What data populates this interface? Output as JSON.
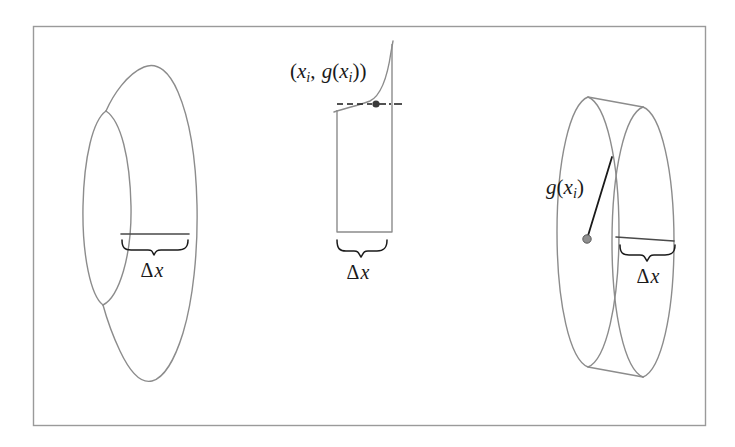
{
  "figure": {
    "name": "disk-method-volume-of-revolution",
    "background_color": "#ffffff",
    "frame": {
      "name": "figure-border",
      "stroke": "#9a9a9a",
      "x": 33,
      "y": 26,
      "width": 672,
      "height": 399
    },
    "line_color": "#8c8c8c",
    "ink_color": "#1a1a1a"
  },
  "labels": {
    "point_label": "(xᵢ, g(xᵢ))",
    "point_label_parts": {
      "open": "(",
      "x": "x",
      "x_sub": "i",
      "comma": ", ",
      "g": "g",
      "g_open": "(",
      "g_x": "x",
      "g_x_sub": "i",
      "g_close": ")",
      "close": ")"
    },
    "radius_label": "g(xᵢ)",
    "radius_label_parts": {
      "g": "g",
      "open": "(",
      "x": "x",
      "x_sub": "i",
      "close": ")"
    },
    "delta_x": "Δx",
    "delta_x_parts": {
      "delta": "Δ",
      "x": "x"
    }
  },
  "panels": [
    {
      "name": "solid-of-revolution",
      "index": 0,
      "description": "Solid of revolution with a shaded slice of width delta-x",
      "delta_x_label": "Δx",
      "delta_x_label_x": 152,
      "delta_x_label_y": 272
    },
    {
      "name": "representative-rectangle",
      "index": 1,
      "description": "Representative rectangle under the curve y = g(x) touching the point (x_i, g(x_i))",
      "point_label": "(xᵢ, g(xᵢ))",
      "point_label_x": 290,
      "point_label_y": 73,
      "delta_x_label": "Δx",
      "delta_x_label_x": 358,
      "delta_x_label_y": 272,
      "rectangle": {
        "left": 337,
        "right": 392,
        "top": 108,
        "bottom": 232
      },
      "marked_point": {
        "x": 376,
        "y": 104
      }
    },
    {
      "name": "disk-element",
      "index": 2,
      "description": "Circular disk of radius g(x_i) and thickness delta-x",
      "radius_label": "g(xᵢ)",
      "radius_label_x": 565,
      "radius_label_y": 188,
      "delta_x_label": "Δx",
      "delta_x_label_x": 648,
      "delta_x_label_y": 272,
      "center_point": {
        "x": 587,
        "y": 239
      },
      "radius_endpoint": {
        "x": 612,
        "y": 157
      }
    }
  ],
  "chart_data": {
    "type": "diagram",
    "title": "",
    "subtitle": "",
    "annotations": [
      "(xᵢ, g(xᵢ))",
      "g(xᵢ)",
      "Δx",
      "Δx",
      "Δx"
    ],
    "legend": [],
    "grid": false
  }
}
